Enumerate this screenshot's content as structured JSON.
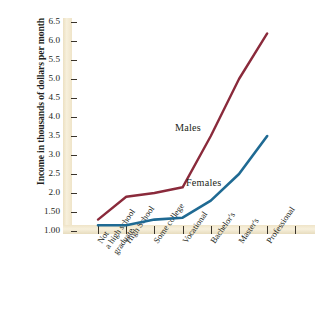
{
  "chart_data": {
    "type": "line",
    "title": "",
    "subtitle": "",
    "xlabel": "",
    "ylabel": "Income in thousands of dollars per month",
    "categories": [
      "Not\na high school\ngraduate",
      "High School",
      "Some college",
      "Vocational",
      "Bachelor's",
      "Master's",
      "Professional"
    ],
    "series": [
      {
        "name": "Males",
        "color": "#8a2a3b",
        "values": [
          1.3,
          1.9,
          2.0,
          2.15,
          3.5,
          5.0,
          6.2
        ]
      },
      {
        "name": "Females",
        "color": "#1f6a93",
        "values": [
          1.15,
          1.15,
          1.3,
          1.35,
          1.8,
          2.5,
          3.5
        ]
      }
    ],
    "ylim": [
      1.0,
      6.5
    ],
    "ytick_labels": [
      "1.00",
      "1.50",
      "2.0",
      "2.5",
      "3.0",
      "3.5",
      "4.0",
      "4.5",
      "5.0",
      "5.5",
      "6.0",
      "6.5"
    ],
    "ytick_values": [
      1.0,
      1.5,
      2.0,
      2.5,
      3.0,
      3.5,
      4.0,
      4.5,
      5.0,
      5.5,
      6.0,
      6.5
    ],
    "grid": false,
    "legend_position": "inline-annotations",
    "annotations": [
      {
        "text": "Males",
        "series": "Males"
      },
      {
        "text": "Females",
        "series": "Females"
      }
    ],
    "axis_band_color": "#f2e8d0",
    "background_color": "#ffffff"
  }
}
